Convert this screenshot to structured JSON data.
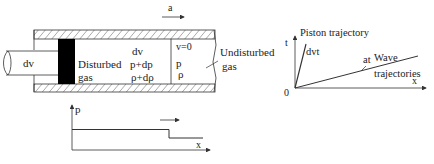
{
  "tube": {
    "rod_label": "dv",
    "disturbed_label_1": "Disturbed",
    "disturbed_label_2": "gas",
    "disturbed_props": [
      "dv",
      "p+dp",
      "ρ+dρ"
    ],
    "undisturbed_props": [
      "v=0",
      "p",
      "ρ"
    ],
    "undisturbed_label_1": "Undisturbed",
    "undisturbed_label_2": "gas",
    "wave_speed_label": "a"
  },
  "pressure_plot": {
    "y_label": "p",
    "x_label": "x"
  },
  "tx_diagram": {
    "t_label": "t",
    "x_label": "x",
    "origin_label": "0",
    "piston_label": "Piston trajectory",
    "piston_slope_label": "dvt",
    "wave_slope_label": "at",
    "wave_label_1": "Wave",
    "wave_label_2": "trajectories"
  },
  "colors": {
    "line": "#333333",
    "piston": "#000000",
    "hatch": "#555555"
  }
}
